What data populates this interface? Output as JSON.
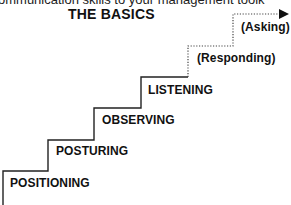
{
  "header": {
    "cut_off_text": "ommunication skills to your management toolk",
    "title": "THE BASICS"
  },
  "steps": [
    {
      "label": "POSITIONING",
      "style": "solid"
    },
    {
      "label": "POSTURING",
      "style": "solid"
    },
    {
      "label": "OBSERVING",
      "style": "solid"
    },
    {
      "label": "LISTENING",
      "style": "solid"
    },
    {
      "label": "(Responding)",
      "style": "dotted"
    },
    {
      "label": "(Asking)",
      "style": "dotted"
    }
  ],
  "icons": {
    "arrow": "arrow-right-icon"
  },
  "colors": {
    "line": "#222222",
    "dotted_line": "#444444",
    "text": "#111111",
    "background": "#ffffff"
  }
}
